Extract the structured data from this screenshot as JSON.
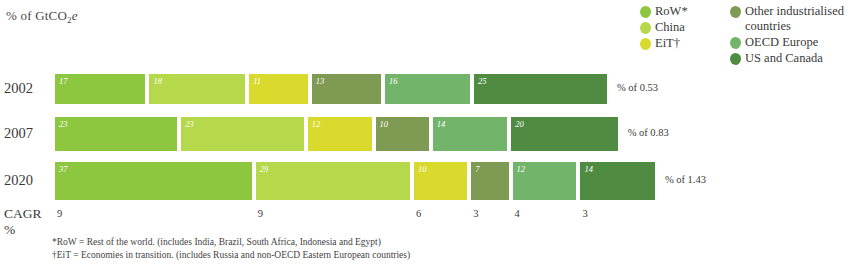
{
  "axis_unit": {
    "prefix": "% of GtCO",
    "subscript": "2",
    "suffix": "e"
  },
  "legend": {
    "columns": [
      {
        "items": [
          {
            "label": "RoW*",
            "color": "#8dc63f"
          },
          {
            "label": "China",
            "color": "#b5d94a"
          },
          {
            "label": "EiT†",
            "color": "#d9d92e"
          }
        ]
      },
      {
        "items": [
          {
            "label": "Other industrialised countries",
            "color": "#7f9a52"
          },
          {
            "label": "OECD Europe",
            "color": "#72b56a"
          },
          {
            "label": "US and Canada",
            "color": "#4f8b41"
          }
        ]
      }
    ]
  },
  "chart_data": {
    "type": "bar",
    "title": "",
    "xlabel": "",
    "ylabel": "% of GtCO2e",
    "orientation": "horizontal",
    "stacked": true,
    "legend_position": "top-right",
    "grid": false,
    "categories": [
      "2002",
      "2007",
      "2020"
    ],
    "series": [
      {
        "name": "RoW*",
        "color": "#8dc63f",
        "values": [
          17,
          23,
          37
        ]
      },
      {
        "name": "China",
        "color": "#b5d94a",
        "values": [
          18,
          23,
          29
        ]
      },
      {
        "name": "EiT†",
        "color": "#d9d92e",
        "values": [
          11,
          12,
          10
        ]
      },
      {
        "name": "Other industrialised countries",
        "color": "#7f9a52",
        "values": [
          13,
          10,
          7
        ]
      },
      {
        "name": "OECD Europe",
        "color": "#72b56a",
        "values": [
          16,
          14,
          12
        ]
      },
      {
        "name": "US and Canada",
        "color": "#4f8b41",
        "values": [
          25,
          20,
          14
        ]
      }
    ],
    "row_totals": [
      {
        "category": "2002",
        "label": "% of 0.53",
        "value": 0.53
      },
      {
        "category": "2007",
        "label": "% of 0.83",
        "value": 0.83
      },
      {
        "category": "2020",
        "label": "% of 1.43",
        "value": 1.43
      }
    ],
    "cagr": {
      "label_line1": "CAGR",
      "label_line2": "%",
      "values": [
        9,
        9,
        6,
        3,
        4,
        3
      ]
    }
  },
  "footnotes": [
    "*RoW = Rest of the world. (includes India, Brazil, South Africa, Indonesia and Egypt)",
    "†EiT = Economies in transition. (includes Russia and non-OECD Eastern European countries)"
  ]
}
